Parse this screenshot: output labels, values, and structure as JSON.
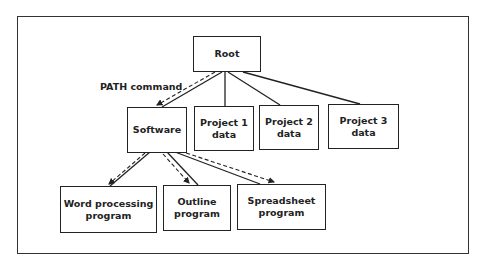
{
  "diagram": {
    "type": "directory-tree",
    "annotation": "PATH command",
    "nodes": {
      "root": {
        "line1": "Root",
        "line2": ""
      },
      "software": {
        "line1": "Software",
        "line2": ""
      },
      "project1": {
        "line1": "Project 1",
        "line2": "data"
      },
      "project2": {
        "line1": "Project 2",
        "line2": "data"
      },
      "project3": {
        "line1": "Project 3",
        "line2": "data"
      },
      "word": {
        "line1": "Word processing",
        "line2": "program"
      },
      "outline": {
        "line1": "Outline",
        "line2": "program"
      },
      "spreadsheet": {
        "line1": "Spreadsheet",
        "line2": "program"
      }
    },
    "edges": [
      [
        "Root",
        "Software"
      ],
      [
        "Root",
        "Project 1 data"
      ],
      [
        "Root",
        "Project 2 data"
      ],
      [
        "Root",
        "Project 3 data"
      ],
      [
        "Software",
        "Word processing program"
      ],
      [
        "Software",
        "Outline program"
      ],
      [
        "Software",
        "Spreadsheet program"
      ]
    ],
    "path_arrows": [
      [
        "Root",
        "Software"
      ],
      [
        "Software",
        "Word processing program"
      ],
      [
        "Software",
        "Outline program"
      ],
      [
        "Software",
        "Spreadsheet program"
      ]
    ],
    "colors": {
      "line": "#222222",
      "background": "#ffffff"
    }
  }
}
